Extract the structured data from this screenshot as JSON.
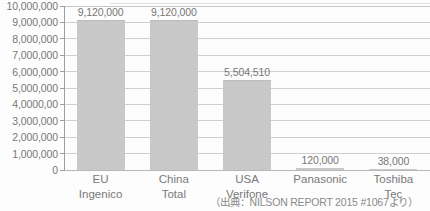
{
  "chart_data": {
    "type": "bar",
    "title": "",
    "subtitle": "",
    "xlabel": "",
    "ylabel": "",
    "categories": [
      "EU Ingenico",
      "China Total",
      "USA Verifone",
      "Panasonic",
      "Toshiba Tec"
    ],
    "category_lines": [
      [
        "EU",
        "Ingenico"
      ],
      [
        "China",
        "Total"
      ],
      [
        "USA",
        "Verifone"
      ],
      [
        "Panasonic",
        ""
      ],
      [
        "Toshiba",
        "Tec"
      ]
    ],
    "values": [
      9120000,
      9120000,
      5504510,
      120000,
      38000
    ],
    "value_labels": [
      "9,120,000",
      "9,120,000",
      "5,504,510",
      "120,000",
      "38,000"
    ],
    "ylim": [
      0,
      10000000
    ],
    "ytick_values": [
      0,
      1000000,
      2000000,
      3000000,
      4000000,
      5000000,
      6000000,
      7000000,
      8000000,
      9000000,
      10000000
    ],
    "ytick_labels": [
      "10,000,000",
      "9,000,000",
      "8,000,000",
      "7,000,000",
      "6,000,000",
      "5,000,000",
      "4,0000,00",
      "3,000,000",
      "2,000,000",
      "1,000,000",
      "0"
    ],
    "grid": true,
    "legend": "none",
    "bar_color": "#c9c9c9",
    "gridline_color": "#cfcfcf",
    "axis_color": "#9e9e9e",
    "text_color": "#787878",
    "background_color": "#fdfdfd"
  },
  "source_note": {
    "text": "（出典：NILSON REPORT 2015 #1067より）"
  }
}
